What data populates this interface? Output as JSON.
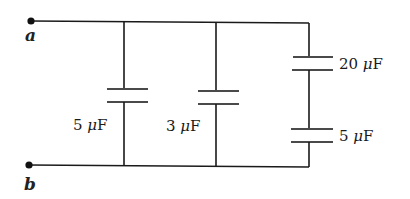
{
  "diagram": {
    "type": "circuit",
    "terminals": [
      {
        "id": "a",
        "label": "a"
      },
      {
        "id": "b",
        "label": "b"
      }
    ],
    "capacitors": [
      {
        "id": "C1",
        "value": "5",
        "unit": "μF",
        "branch": 1,
        "position": "parallel"
      },
      {
        "id": "C2",
        "value": "3",
        "unit": "μF",
        "branch": 2,
        "position": "parallel"
      },
      {
        "id": "C3",
        "value": "20",
        "unit": "μF",
        "branch": 3,
        "position": "series-top"
      },
      {
        "id": "C4",
        "value": "5",
        "unit": "μF",
        "branch": 3,
        "position": "series-bottom"
      }
    ],
    "labels": {
      "c1": "5 ",
      "c2": "3 ",
      "c3": "20 ",
      "c4": "5 ",
      "mu": "μ",
      "farad": "F"
    },
    "colors": {
      "wire": "#1a1a1a",
      "plate": "#4a4a4a",
      "text": "#1a1a1a"
    }
  }
}
